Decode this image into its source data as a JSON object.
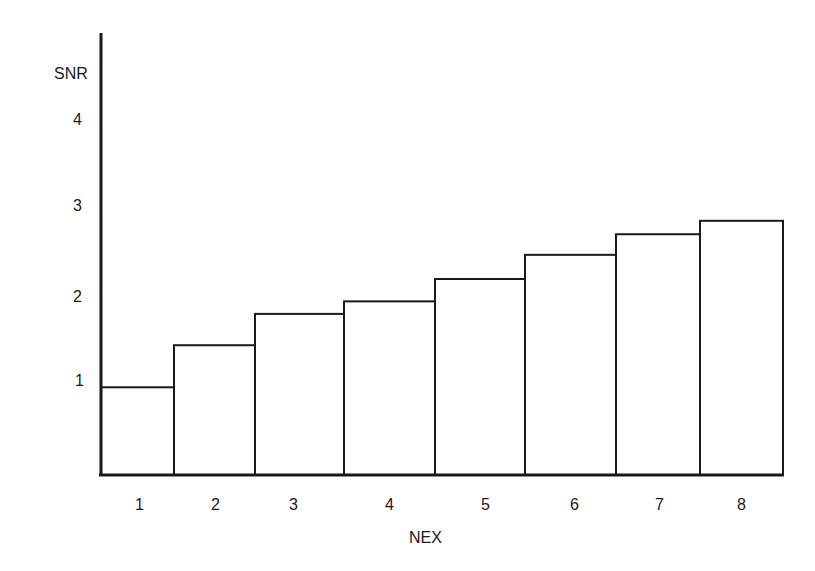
{
  "chart_data": {
    "type": "bar",
    "title": "",
    "xlabel": "NEX",
    "ylabel": "SNR",
    "categories": [
      "1",
      "2",
      "3",
      "4",
      "5",
      "6",
      "7",
      "8"
    ],
    "values": [
      0.98,
      1.45,
      1.8,
      1.94,
      2.19,
      2.46,
      2.69,
      2.84
    ],
    "ylim": [
      0,
      4.5
    ],
    "yticks": [
      "1",
      "2",
      "3",
      "4"
    ],
    "grid": false,
    "legend": null,
    "bar_style": "outlined, adjacent bars, no fill",
    "colors": {
      "stroke": "#1a1a1a",
      "fill": "#ffffff"
    }
  },
  "labels": {
    "ylabel": "SNR",
    "xlabel": "NEX",
    "yticks": [
      "4",
      "3",
      "2",
      "1"
    ],
    "xticks": [
      "1",
      "2",
      "3",
      "4",
      "5",
      "6",
      "7",
      "8"
    ]
  }
}
